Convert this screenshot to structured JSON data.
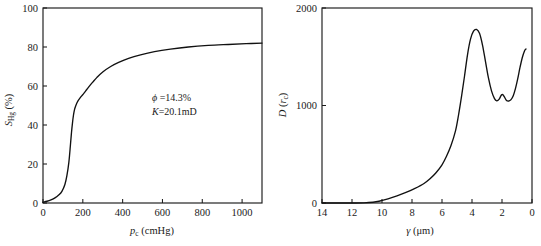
{
  "figure": {
    "background": "#ffffff",
    "ink": "#1a1a1a"
  },
  "chart_data": [
    {
      "id": "capillary-pressure-curve",
      "type": "line",
      "title": "",
      "xlabel": "p_c (cmHg)",
      "xlabel_symbol": "p",
      "xlabel_subscript": "c",
      "xlabel_units": "(cmHg)",
      "ylabel": "S_Hg (%)",
      "ylabel_symbol": "S",
      "ylabel_subscript": "Hg",
      "ylabel_units": "(%)",
      "xlim": [
        0,
        1100
      ],
      "ylim": [
        0,
        100
      ],
      "x_reversed": false,
      "grid": false,
      "legend": "none",
      "xticks": [
        0,
        200,
        400,
        600,
        800,
        1000
      ],
      "xticklabels": [
        "0",
        "200",
        "400",
        "600",
        "800",
        "1000"
      ],
      "yticks": [
        0,
        20,
        40,
        60,
        80,
        100
      ],
      "yticklabels": [
        "0",
        "20",
        "40",
        "60",
        "80",
        "100"
      ],
      "x": [
        0,
        20,
        40,
        60,
        80,
        95,
        110,
        120,
        130,
        138,
        143,
        148,
        153,
        158,
        165,
        175,
        190,
        205,
        220,
        235,
        250,
        270,
        300,
        340,
        380,
        430,
        490,
        560,
        640,
        730,
        830,
        930,
        1020,
        1100
      ],
      "y": [
        0.4,
        0.9,
        1.6,
        2.6,
        4.2,
        6.0,
        9.5,
        14.0,
        21.0,
        30.0,
        36.0,
        41.0,
        45.0,
        47.8,
        50.0,
        52.2,
        54.4,
        56.2,
        58.2,
        60.2,
        62.0,
        64.3,
        67.2,
        70.0,
        72.1,
        74.2,
        76.0,
        77.6,
        78.9,
        80.0,
        80.8,
        81.3,
        81.7,
        82.0
      ],
      "annotations": [
        {
          "symbol": "ϕ",
          "text": " =14.3%"
        },
        {
          "symbol": "K",
          "text": "=20.1mD"
        }
      ]
    },
    {
      "id": "pore-size-distribution",
      "type": "line",
      "title": "",
      "xlabel": "γ (μm)",
      "xlabel_symbol": "γ",
      "xlabel_units": "(μm)",
      "ylabel": "D (r_c)",
      "ylabel_symbol": "D",
      "ylabel_arg": "r",
      "ylabel_arg_subscript": "c",
      "xlim": [
        0,
        14
      ],
      "ylim": [
        0,
        2000
      ],
      "x_reversed": true,
      "grid": false,
      "legend": "none",
      "xticks": [
        14,
        12,
        10,
        8,
        6,
        4,
        2,
        0
      ],
      "xticklabels": [
        "14",
        "12",
        "10",
        "8",
        "6",
        "4",
        "2",
        "0"
      ],
      "yticks": [
        0,
        1000,
        2000
      ],
      "yticklabels": [
        "0",
        "1000",
        "2000"
      ],
      "x": [
        14.0,
        13.0,
        12.0,
        11.2,
        10.6,
        10.2,
        9.6,
        9.0,
        8.4,
        7.8,
        7.2,
        6.8,
        6.4,
        6.0,
        5.7,
        5.4,
        5.1,
        4.9,
        4.7,
        4.5,
        4.3,
        4.1,
        3.9,
        3.7,
        3.5,
        3.3,
        3.1,
        2.9,
        2.7,
        2.5,
        2.35,
        2.2,
        2.05,
        1.95,
        1.85,
        1.7,
        1.55,
        1.4,
        1.25,
        1.1,
        0.95,
        0.8,
        0.65,
        0.5,
        0.4
      ],
      "y": [
        0,
        0,
        0,
        2,
        8,
        18,
        42,
        72,
        108,
        150,
        200,
        248,
        310,
        392,
        480,
        590,
        740,
        900,
        1090,
        1300,
        1520,
        1680,
        1762,
        1780,
        1740,
        1620,
        1450,
        1280,
        1150,
        1070,
        1048,
        1062,
        1105,
        1112,
        1090,
        1052,
        1046,
        1060,
        1100,
        1175,
        1275,
        1390,
        1490,
        1560,
        1580
      ]
    }
  ],
  "panels": {
    "left": {
      "name": "capillary-pressure-panel",
      "xlabel_symbol": "p",
      "xlabel_sub": "c",
      "xlabel_units": "(cmHg)",
      "ylabel_symbol": "S",
      "ylabel_sub": "Hg",
      "ylabel_units": "(%)",
      "xticklabels": [
        "0",
        "200",
        "400",
        "600",
        "800",
        "1000"
      ],
      "yticklabels": [
        "0",
        "20",
        "40",
        "60",
        "80",
        "100"
      ],
      "annotation_line1_symbol": "ϕ",
      "annotation_line1_text": " =14.3%",
      "annotation_line2_symbol": "K",
      "annotation_line2_text": "=20.1mD"
    },
    "right": {
      "name": "pore-size-distribution-panel",
      "xlabel_symbol": "γ",
      "xlabel_units": "(μm)",
      "ylabel_symbol": "D",
      "ylabel_arg_open": " (",
      "ylabel_arg": "r",
      "ylabel_arg_sub": "c",
      "ylabel_arg_close": ")",
      "xticklabels": [
        "14",
        "12",
        "10",
        "8",
        "6",
        "4",
        "2",
        "0"
      ],
      "yticklabels": [
        "0",
        "1000",
        "2000"
      ]
    }
  }
}
